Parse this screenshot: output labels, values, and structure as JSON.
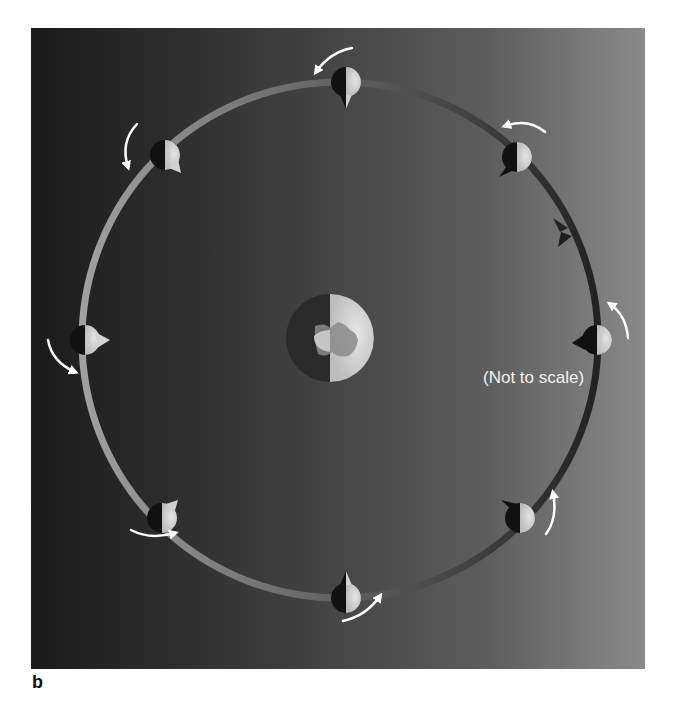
{
  "figure": {
    "panel_label": "b",
    "caption": "(Not to scale)"
  },
  "colors": {
    "background_left": "#1a1a1a",
    "background_right": "#8a8a8a",
    "orbit_light": "#9a9a9a",
    "orbit_dark": "#2a2a2a",
    "moon_lit": "#d8d8d8",
    "moon_dark": "#111111",
    "arrow": "#ffffff"
  },
  "earth": {
    "cx": 330,
    "cy": 338,
    "r": 44,
    "lit_side": "right"
  },
  "orbit": {
    "cx": 340,
    "cy": 340,
    "r": 258,
    "direction": "counter-clockwise"
  },
  "moons": [
    {
      "id": "top",
      "angle_deg": 90,
      "x": 346,
      "y": 82
    },
    {
      "id": "upper-right",
      "angle_deg": 45,
      "x": 517,
      "y": 157
    },
    {
      "id": "right",
      "angle_deg": 0,
      "x": 597,
      "y": 340
    },
    {
      "id": "lower-right",
      "angle_deg": -45,
      "x": 520,
      "y": 518
    },
    {
      "id": "bottom",
      "angle_deg": -90,
      "x": 346,
      "y": 598
    },
    {
      "id": "lower-left",
      "angle_deg": -135,
      "x": 162,
      "y": 518
    },
    {
      "id": "left",
      "angle_deg": 180,
      "x": 85,
      "y": 340
    },
    {
      "id": "upper-left",
      "angle_deg": 135,
      "x": 165,
      "y": 155
    }
  ]
}
